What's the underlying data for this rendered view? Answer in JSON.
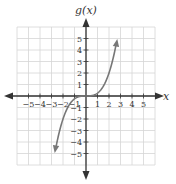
{
  "chart_data": {
    "type": "line",
    "title": "",
    "xlabel": "x",
    "ylabel": "g(x)",
    "xlim": [
      -6,
      6
    ],
    "ylim": [
      -6,
      6
    ],
    "grid": true,
    "x_ticks": [
      -5,
      -4,
      -3,
      -2,
      -1,
      1,
      2,
      3,
      4,
      5
    ],
    "y_ticks": [
      -5,
      -4,
      -3,
      -2,
      -1,
      1,
      2,
      3,
      4,
      5
    ],
    "series": [
      {
        "name": "g(x)",
        "function": "approximately x^3/4",
        "x": [
          -2.7,
          -2.5,
          -2,
          -1.5,
          -1,
          -0.5,
          0,
          0.5,
          1,
          1.5,
          2,
          2.5,
          2.7
        ],
        "values": [
          -4.9,
          -3.9,
          -2.0,
          -0.84,
          -0.25,
          -0.03,
          0,
          0.03,
          0.25,
          0.84,
          2.0,
          3.9,
          4.9
        ],
        "arrows_at_ends": true,
        "color": "#777777"
      }
    ]
  },
  "labels": {
    "x_axis": "x",
    "y_axis": "g(x)"
  },
  "colors": {
    "grid": "#d6d6d6",
    "axis": "#333333",
    "curve": "#777777"
  }
}
